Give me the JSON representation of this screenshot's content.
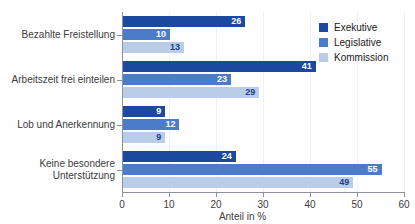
{
  "chart_data": {
    "type": "bar",
    "orientation": "horizontal",
    "title": "",
    "xlabel": "Anteil in %",
    "ylabel": "",
    "xlim": [
      0,
      60
    ],
    "xticks": [
      0,
      10,
      20,
      30,
      40,
      50,
      60
    ],
    "grid": true,
    "legend_position": "top-right",
    "categories": [
      "Bezahlte Freistellung",
      "Arbeitszeit frei einteilen",
      "Lob und Anerkennung",
      "Keine besondere\nUnterstützung"
    ],
    "series": [
      {
        "name": "Exekutive",
        "color": "#1b49a0",
        "values": [
          26,
          41,
          9,
          24
        ]
      },
      {
        "name": "Legislative",
        "color": "#4a7cc9",
        "values": [
          10,
          23,
          12,
          55
        ]
      },
      {
        "name": "Kommission",
        "color": "#b9cde9",
        "values": [
          13,
          29,
          9,
          49
        ]
      }
    ]
  },
  "axis": {
    "x_title": "Anteil in %",
    "tick_labels": [
      "0",
      "10",
      "20",
      "30",
      "40",
      "50",
      "60"
    ]
  },
  "legend": {
    "items": [
      {
        "label": "Exekutive"
      },
      {
        "label": "Legislative"
      },
      {
        "label": "Kommission"
      }
    ]
  },
  "values_flat": {
    "g0s0": "26",
    "g0s1": "10",
    "g0s2": "13",
    "g1s0": "41",
    "g1s1": "23",
    "g1s2": "29",
    "g2s0": "9",
    "g2s1": "12",
    "g2s2": "9",
    "g3s0": "24",
    "g3s1": "55",
    "g3s2": "49"
  }
}
